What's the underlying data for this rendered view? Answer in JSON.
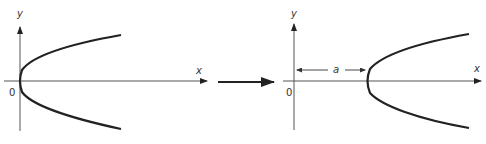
{
  "diagram": {
    "type": "parabola-translation",
    "colors": {
      "ink": "#222222",
      "axis": "#555555",
      "background": "#ffffff"
    },
    "left_panel": {
      "y_label": "y",
      "x_label": "x",
      "origin_label": "0",
      "curve": "parabola opening right, vertex at origin"
    },
    "transition_arrow": {
      "direction": "right"
    },
    "right_panel": {
      "y_label": "y",
      "x_label": "x",
      "origin_label": "0",
      "shift_label": "a",
      "curve": "parabola opening right, vertex shifted to x = a"
    }
  }
}
